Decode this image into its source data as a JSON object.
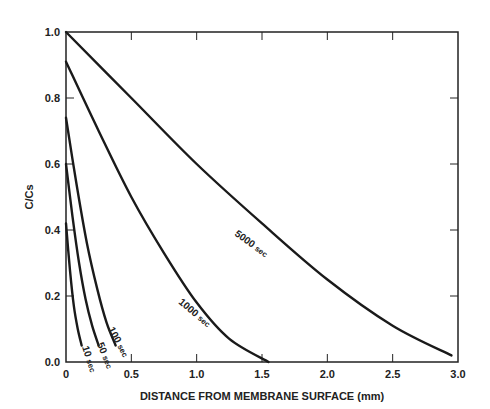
{
  "chart_data": {
    "type": "line",
    "title": "",
    "xlabel": "DISTANCE FROM MEMBRANE SURFACE (mm)",
    "ylabel": "C/Cs",
    "xlim": [
      0,
      3.0
    ],
    "ylim": [
      0.0,
      1.0
    ],
    "xticks": [
      "0",
      "0.5",
      "1.0",
      "1.5",
      "2.0",
      "2.5",
      "3.0"
    ],
    "yticks": [
      "0.0",
      "0.2",
      "0.4",
      "0.6",
      "0.8",
      "1.0"
    ],
    "grid": false,
    "legend": "inline curve labels",
    "series": [
      {
        "name": "10 sec",
        "label_num": "10",
        "label_unit": "sec",
        "x": [
          0,
          0.03,
          0.06,
          0.09,
          0.12
        ],
        "y": [
          0.42,
          0.28,
          0.17,
          0.1,
          0.05
        ]
      },
      {
        "name": "50 sec",
        "label_num": "50",
        "label_unit": "sec",
        "x": [
          0,
          0.05,
          0.1,
          0.15,
          0.2,
          0.25
        ],
        "y": [
          0.6,
          0.44,
          0.3,
          0.19,
          0.11,
          0.05
        ]
      },
      {
        "name": "100 sec",
        "label_num": "100",
        "label_unit": "sec",
        "x": [
          0,
          0.08,
          0.16,
          0.24,
          0.31,
          0.38
        ],
        "y": [
          0.74,
          0.54,
          0.36,
          0.22,
          0.12,
          0.05
        ]
      },
      {
        "name": "1000 sec",
        "label_num": "1000",
        "label_unit": "sec",
        "x": [
          0,
          0.25,
          0.5,
          0.75,
          1.0,
          1.25,
          1.55
        ],
        "y": [
          0.91,
          0.7,
          0.5,
          0.33,
          0.18,
          0.07,
          0.0
        ]
      },
      {
        "name": "5000 sec",
        "label_num": "5000",
        "label_unit": "sec",
        "x": [
          0,
          0.5,
          1.0,
          1.5,
          2.0,
          2.5,
          2.95
        ],
        "y": [
          1.0,
          0.8,
          0.6,
          0.42,
          0.25,
          0.11,
          0.02
        ]
      }
    ]
  }
}
